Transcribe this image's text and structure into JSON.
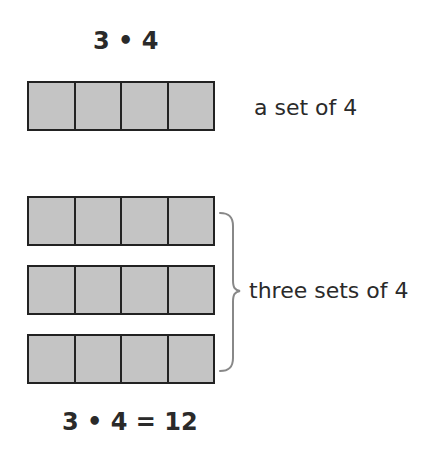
{
  "title_expression": "3 • 4",
  "single_set": {
    "label": "a set of 4",
    "cells": 4
  },
  "grouped_sets": {
    "label": "three sets of 4",
    "rows": 3,
    "cells_per_row": 4
  },
  "result_expression": "3 • 4 = 12",
  "colors": {
    "cell_fill": "#c4c4c4",
    "cell_border": "#222222",
    "brace": "#888888",
    "text": "#2a2a2a"
  }
}
